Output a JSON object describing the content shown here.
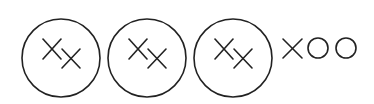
{
  "diagram": {
    "stroke_color": "#222222",
    "background": "#ffffff",
    "circles": [
      {
        "label": "cell-1",
        "cx": 61,
        "cy": 58,
        "r": 39,
        "contents": [
          "X",
          "X"
        ]
      },
      {
        "label": "cell-2",
        "cx": 147,
        "cy": 58,
        "r": 39,
        "contents": [
          "X",
          "X"
        ]
      },
      {
        "label": "cell-3",
        "cx": 233,
        "cy": 58,
        "r": 39,
        "contents": [
          "X",
          "X"
        ]
      }
    ],
    "trailing_symbols": [
      "X",
      "O",
      "O"
    ]
  }
}
